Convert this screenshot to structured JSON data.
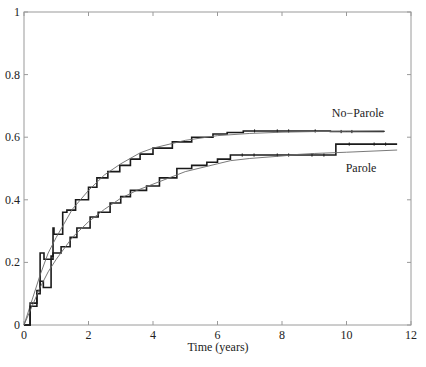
{
  "chart_data": {
    "type": "line",
    "title": "",
    "xlabel": "Time (years)",
    "ylabel": "",
    "xlim": [
      0,
      12
    ],
    "ylim": [
      0,
      1
    ],
    "x_ticks": [
      0,
      2,
      4,
      6,
      8,
      10,
      12
    ],
    "x_tick_labels": [
      "0",
      "2",
      "4",
      "6",
      "8",
      "10",
      "12"
    ],
    "y_ticks": [
      0,
      0.2,
      0.4,
      0.6,
      0.8,
      1
    ],
    "y_tick_labels": [
      "0",
      "0.2",
      "0.4",
      "0.6",
      "0.8",
      "1"
    ],
    "grid": false,
    "legend": "none (inline labels)",
    "annotations": [
      {
        "text": "No−Parole",
        "x": 10.35,
        "y": 0.665
      },
      {
        "text": "Parole",
        "x": 10.45,
        "y": 0.49
      }
    ],
    "series": [
      {
        "name": "No-Parole (empirical step)",
        "style": "step",
        "x": [
          0,
          0.19,
          0.4,
          0.5,
          0.62,
          0.9,
          0.93,
          1.2,
          1.33,
          1.6,
          2.0,
          2.26,
          2.6,
          2.97,
          3.3,
          3.6,
          4.0,
          4.6,
          5.2,
          5.86,
          6.3,
          6.8,
          7.5,
          8.56,
          9.5,
          10.5,
          11.16
        ],
        "y": [
          0,
          0.07,
          0.11,
          0.23,
          0.21,
          0.31,
          0.29,
          0.36,
          0.367,
          0.4,
          0.44,
          0.47,
          0.49,
          0.51,
          0.53,
          0.546,
          0.565,
          0.585,
          0.6,
          0.61,
          0.615,
          0.62,
          0.62,
          0.62,
          0.618,
          0.618,
          0.617
        ]
      },
      {
        "name": "No-Parole (fitted)",
        "style": "smooth",
        "x": [
          0,
          0.25,
          0.5,
          0.75,
          1.0,
          1.5,
          2.0,
          2.5,
          3.0,
          3.6,
          4.0,
          5.0,
          6.0,
          7.0,
          8.0,
          9.0,
          10.0,
          11.16
        ],
        "y": [
          0,
          0.08,
          0.16,
          0.23,
          0.28,
          0.37,
          0.43,
          0.48,
          0.515,
          0.55,
          0.565,
          0.59,
          0.605,
          0.612,
          0.616,
          0.618,
          0.619,
          0.62
        ]
      },
      {
        "name": "Parole (empirical step)",
        "style": "step",
        "x": [
          0,
          0.19,
          0.4,
          0.5,
          0.6,
          0.84,
          0.9,
          1.15,
          1.43,
          1.64,
          2.05,
          2.3,
          2.67,
          3.0,
          3.3,
          3.8,
          4.2,
          4.74,
          5.2,
          5.67,
          6.0,
          6.4,
          7.5,
          8.56,
          9.67,
          9.67,
          10.5,
          11.57
        ],
        "y": [
          0,
          0.06,
          0.1,
          0.14,
          0.12,
          0.22,
          0.23,
          0.25,
          0.28,
          0.31,
          0.345,
          0.36,
          0.39,
          0.41,
          0.43,
          0.444,
          0.47,
          0.5,
          0.51,
          0.52,
          0.53,
          0.543,
          0.543,
          0.543,
          0.546,
          0.578,
          0.578,
          0.578
        ]
      },
      {
        "name": "Parole (fitted)",
        "style": "smooth",
        "x": [
          0,
          0.25,
          0.5,
          0.75,
          1.0,
          1.5,
          2.0,
          2.5,
          3.0,
          3.5,
          4.0,
          5.0,
          6.0,
          6.4,
          7.0,
          8.0,
          8.5,
          9.0,
          10.0,
          11.57
        ],
        "y": [
          0,
          0.06,
          0.12,
          0.17,
          0.21,
          0.28,
          0.33,
          0.37,
          0.405,
          0.43,
          0.45,
          0.49,
          0.515,
          0.525,
          0.532,
          0.54,
          0.545,
          0.548,
          0.552,
          0.559
        ]
      }
    ]
  },
  "axes": {
    "xlabel": "Time (years)"
  },
  "labels": {
    "no_parole": "No−Parole",
    "parole": "Parole"
  }
}
